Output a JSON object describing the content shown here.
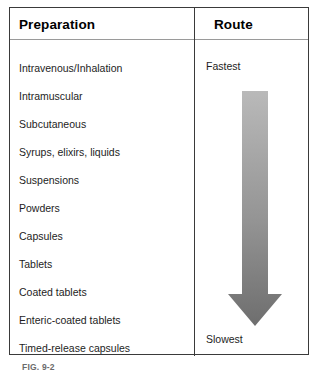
{
  "figure": {
    "caption_id": "FIG. 9-2",
    "caption_text": ""
  },
  "table": {
    "columns": [
      {
        "key": "preparation",
        "label": "Preparation"
      },
      {
        "key": "route",
        "label": "Route"
      }
    ],
    "rows": [
      {
        "preparation": "Intravenous/Inhalation"
      },
      {
        "preparation": "Intramuscular"
      },
      {
        "preparation": "Subcutaneous"
      },
      {
        "preparation": "Syrups, elixirs, liquids"
      },
      {
        "preparation": "Suspensions"
      },
      {
        "preparation": "Powders"
      },
      {
        "preparation": "Capsules"
      },
      {
        "preparation": "Tablets"
      },
      {
        "preparation": "Coated tablets"
      },
      {
        "preparation": "Enteric-coated tablets"
      },
      {
        "preparation": "Timed-release capsules"
      }
    ]
  },
  "route": {
    "top_label": "Fastest",
    "bottom_label": "Slowest",
    "arrow": {
      "direction": "down",
      "gradient_start_color": "#b9b9b9",
      "gradient_end_color": "#6e6e6e"
    }
  },
  "colors": {
    "border": "#3a3a3a",
    "header_rule": "#9a9a9a",
    "text": "#1d1d1d",
    "caption_text": "#6b6b6b",
    "background": "#ffffff"
  }
}
